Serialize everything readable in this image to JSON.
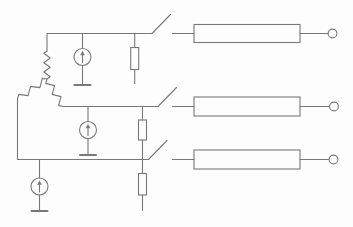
{
  "canvas": {
    "width": 353,
    "height": 227,
    "background": "#fdfdfd",
    "stroke_color": "#787878",
    "stroke_width": 1.1,
    "bar_stroke_width": 2
  },
  "schematic": {
    "kind": "circuit-schematic",
    "wires": [
      {
        "name": "rail-1",
        "x1": 47,
        "y1": 33.5,
        "x2": 152,
        "y2": 33.5
      },
      {
        "name": "winding-a-lead",
        "x1": 47,
        "y1": 33.5,
        "x2": 47,
        "y2": 51
      },
      {
        "name": "source-1-top-stem",
        "x1": 82.5,
        "y1": 33.5,
        "x2": 82.5,
        "y2": 48.5
      },
      {
        "name": "resistor-1-top-stem",
        "x1": 134.7,
        "y1": 33.5,
        "x2": 134.7,
        "y2": 47.5
      },
      {
        "name": "resistor-1-bottom-stem",
        "x1": 134.7,
        "y1": 69.5,
        "x2": 134.7,
        "y2": 83.5
      },
      {
        "name": "source-1-bottom-stem",
        "x1": 82.5,
        "y1": 65.5,
        "x2": 82.5,
        "y2": 85
      },
      {
        "name": "switch-1-stub",
        "x1": 172.5,
        "y1": 33.5,
        "x2": 194,
        "y2": 33.5
      },
      {
        "name": "box-1-output-link",
        "x1": 300,
        "y1": 33.5,
        "x2": 328.5,
        "y2": 33.5
      },
      {
        "name": "rail-2",
        "x1": 63,
        "y1": 106.5,
        "x2": 158,
        "y2": 106.5
      },
      {
        "name": "source-2-top-stem",
        "x1": 88,
        "y1": 106.5,
        "x2": 88,
        "y2": 121.5
      },
      {
        "name": "source-2-bottom-stem",
        "x1": 88,
        "y1": 138.5,
        "x2": 88,
        "y2": 155
      },
      {
        "name": "resistor-2-top-stem",
        "x1": 142.5,
        "y1": 106.5,
        "x2": 142.5,
        "y2": 120
      },
      {
        "name": "resistor-2-bottom-stem",
        "x1": 142.5,
        "y1": 140,
        "x2": 142.5,
        "y2": 159.5
      },
      {
        "name": "switch-2-stub",
        "x1": 172.5,
        "y1": 106.5,
        "x2": 194,
        "y2": 106.5
      },
      {
        "name": "box-2-output-link",
        "x1": 300,
        "y1": 106.5,
        "x2": 329,
        "y2": 106.5
      },
      {
        "name": "left-branch-drop",
        "x1": 17.5,
        "y1": 99,
        "x2": 17.5,
        "y2": 159.5
      },
      {
        "name": "rail-3",
        "x1": 17.5,
        "y1": 159.5,
        "x2": 148.5,
        "y2": 159.5
      },
      {
        "name": "source-3-top-stem",
        "x1": 39.5,
        "y1": 159.5,
        "x2": 39.5,
        "y2": 178
      },
      {
        "name": "source-3-bottom-stem",
        "x1": 39.5,
        "y1": 195,
        "x2": 39.5,
        "y2": 211
      },
      {
        "name": "resistor-3-top-stem",
        "x1": 142.5,
        "y1": 159.5,
        "x2": 142.5,
        "y2": 173.5
      },
      {
        "name": "resistor-3-bottom-stem",
        "x1": 142.5,
        "y1": 195,
        "x2": 142.5,
        "y2": 210.5
      },
      {
        "name": "switch-3-stub",
        "x1": 172.5,
        "y1": 159.5,
        "x2": 194,
        "y2": 159.5
      },
      {
        "name": "box-3-output-link",
        "x1": 300,
        "y1": 159.5,
        "x2": 328.5,
        "y2": 159.5
      }
    ],
    "windings": [
      {
        "name": "winding-vertical",
        "from": [
          47,
          51
        ],
        "to": [
          47,
          79
        ],
        "bumps": 6,
        "amp": 3.2
      },
      {
        "name": "winding-left",
        "from": [
          47,
          79
        ],
        "to": [
          17.5,
          99
        ],
        "bumps": 5,
        "amp": 3.2
      },
      {
        "name": "winding-right",
        "from": [
          47,
          79
        ],
        "to": [
          63,
          106.5
        ],
        "bumps": 5,
        "amp": 3.2
      }
    ],
    "resistor_boxes": [
      {
        "name": "resistor-1",
        "x": 130.7,
        "y": 47.5,
        "w": 8,
        "h": 22
      },
      {
        "name": "resistor-2",
        "x": 138.5,
        "y": 120,
        "w": 8,
        "h": 20
      },
      {
        "name": "resistor-3",
        "x": 138.5,
        "y": 173.5,
        "w": 8,
        "h": 21.5
      }
    ],
    "line_boxes": [
      {
        "name": "line-box-1",
        "x": 194,
        "y": 24.5,
        "w": 106,
        "h": 18
      },
      {
        "name": "line-box-2",
        "x": 194,
        "y": 97,
        "w": 106,
        "h": 19
      },
      {
        "name": "line-box-3",
        "x": 194,
        "y": 150,
        "w": 106,
        "h": 19
      }
    ],
    "current_sources": [
      {
        "name": "current-source-1",
        "cx": 82.5,
        "cy": 57,
        "r": 8.5
      },
      {
        "name": "current-source-2",
        "cx": 88,
        "cy": 130,
        "r": 8.5
      },
      {
        "name": "current-source-3",
        "cx": 39.5,
        "cy": 186.5,
        "r": 8.5
      }
    ],
    "ground_bars": [
      {
        "name": "ground-bar-1",
        "x1": 74.5,
        "y1": 85,
        "x2": 90.5,
        "y2": 85
      },
      {
        "name": "ground-bar-2",
        "x1": 80,
        "y1": 155,
        "x2": 96,
        "y2": 155
      },
      {
        "name": "ground-bar-3",
        "x1": 31.5,
        "y1": 211,
        "x2": 47.5,
        "y2": 211
      }
    ],
    "switch_blades": [
      {
        "name": "switch-1-blade",
        "x1": 152,
        "y1": 33.5,
        "x2": 170.5,
        "y2": 14.5
      },
      {
        "name": "switch-2-blade",
        "x1": 158,
        "y1": 106.5,
        "x2": 176.5,
        "y2": 87.5
      },
      {
        "name": "switch-3-blade",
        "x1": 148.5,
        "y1": 159.5,
        "x2": 167,
        "y2": 140.5
      }
    ],
    "terminals": [
      {
        "name": "output-terminal-1",
        "cx": 332.5,
        "cy": 33.5,
        "r": 4.4
      },
      {
        "name": "output-terminal-2",
        "cx": 334,
        "cy": 106.5,
        "r": 4.4
      },
      {
        "name": "output-terminal-3",
        "cx": 333.5,
        "cy": 159.5,
        "r": 4.4
      }
    ]
  }
}
